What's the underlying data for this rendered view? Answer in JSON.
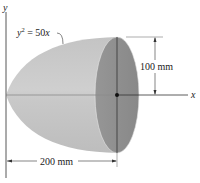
{
  "figure": {
    "type": "paraboloid-of-revolution",
    "axes": {
      "y_label": "y",
      "x_label": "x"
    },
    "curve_equation": {
      "lhs_var": "y",
      "exponent": "2",
      "rhs": " = 50",
      "rhs_var": "x"
    },
    "dimensions": {
      "radius": "100 mm",
      "length": "200 mm"
    },
    "colors": {
      "body": "#b9b9b9",
      "body_light": "#d2d2d2",
      "face": "#8e8e8e",
      "line": "#333333"
    }
  }
}
